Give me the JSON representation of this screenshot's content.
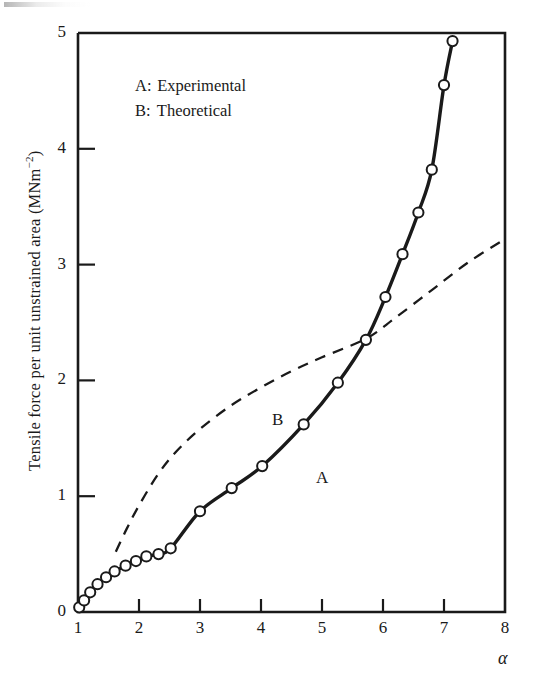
{
  "figure": {
    "y_axis_label_main": "Tensile force per unit unstrained area  (MNm",
    "y_axis_label_exponent": "−2",
    "y_axis_label_close": ")",
    "x_axis_label": "α",
    "legend": [
      {
        "key": "A:",
        "label": "Experimental"
      },
      {
        "key": "B:",
        "label": "Theoretical"
      }
    ],
    "curve_tags": {
      "a": "A",
      "b": "B"
    },
    "x_ticks": [
      "1",
      "2",
      "3",
      "4",
      "5",
      "6",
      "7",
      "8"
    ],
    "y_ticks": [
      "0",
      "1",
      "2",
      "3",
      "4",
      "5"
    ],
    "colors": {
      "ink": "#1a1a1a",
      "background": "#ffffff",
      "marker_fill": "#ffffff"
    }
  },
  "chart_data": {
    "type": "line",
    "title": "",
    "subtitle": "",
    "xlabel": "α",
    "ylabel": "Tensile force per unit unstrained area (MNm−2)",
    "xlim": [
      1,
      8
    ],
    "ylim": [
      0,
      5
    ],
    "x_ticks": [
      1,
      2,
      3,
      4,
      5,
      6,
      7,
      8
    ],
    "y_ticks": [
      0,
      1,
      2,
      3,
      4,
      5
    ],
    "grid": false,
    "legend_position": "upper-left-inside",
    "annotations": [
      {
        "text": "A",
        "x": 5.0,
        "y": 1.42,
        "note": "label on experimental solid curve"
      },
      {
        "text": "B",
        "x": 4.2,
        "y": 1.78,
        "note": "label on theoretical dashed curve"
      }
    ],
    "series": [
      {
        "name": "A: Experimental",
        "style": "solid-with-open-circle-markers",
        "marker": "open-circle",
        "x": [
          1.02,
          1.1,
          1.2,
          1.32,
          1.46,
          1.6,
          1.78,
          1.95,
          2.12,
          2.32,
          2.52,
          3.0,
          3.52,
          4.02,
          4.7,
          5.26,
          5.72,
          6.04,
          6.32,
          6.58,
          6.8,
          7.0,
          7.14
        ],
        "y": [
          0.04,
          0.1,
          0.17,
          0.24,
          0.3,
          0.35,
          0.4,
          0.44,
          0.48,
          0.5,
          0.55,
          0.87,
          1.07,
          1.26,
          1.62,
          1.98,
          2.35,
          2.72,
          3.09,
          3.45,
          3.82,
          4.55,
          4.93
        ]
      },
      {
        "name": "B: Theoretical",
        "style": "dashed",
        "marker": "none",
        "x": [
          1.62,
          1.8,
          2.0,
          2.3,
          2.6,
          3.0,
          3.5,
          4.0,
          4.5,
          5.0,
          5.72,
          6.2,
          6.8,
          7.4,
          8.0
        ],
        "y": [
          0.52,
          0.72,
          0.92,
          1.18,
          1.38,
          1.58,
          1.78,
          1.94,
          2.08,
          2.2,
          2.36,
          2.54,
          2.78,
          3.02,
          3.22
        ]
      }
    ]
  }
}
